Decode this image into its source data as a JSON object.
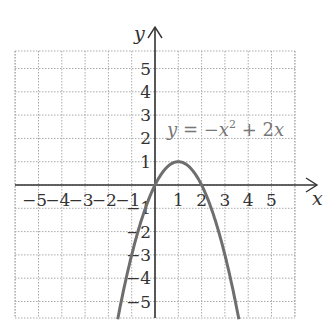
{
  "chart_data": {
    "type": "line",
    "title": "",
    "equation": "y = −x² + 2x",
    "eq_parts": {
      "lhs": "y",
      "eq": " = −",
      "x": "x",
      "exp": "2",
      "rest": " + 2",
      "x2": "x"
    },
    "xlabel": "x",
    "ylabel": "y",
    "xlim": [
      -6,
      6
    ],
    "ylim": [
      -6,
      6
    ],
    "x_ticks": [
      "−5",
      "−4",
      "−3",
      "−2",
      "−1",
      "1",
      "2",
      "3",
      "4",
      "5"
    ],
    "x_tick_values": [
      -5,
      -4,
      -3,
      -2,
      -1,
      1,
      2,
      3,
      4,
      5
    ],
    "y_ticks": [
      "5",
      "4",
      "3",
      "2",
      "1",
      "−1",
      "−2",
      "−3",
      "−4",
      "−5"
    ],
    "y_tick_values": [
      5,
      4,
      3,
      2,
      1,
      -1,
      -2,
      -3,
      -4,
      -5
    ],
    "grid": true,
    "series": [
      {
        "name": "y = -x^2 + 2x",
        "color": "#6e6e6e",
        "x": [
          -1.6,
          -1,
          0,
          0.5,
          1,
          1.5,
          2,
          3,
          3.6
        ],
        "y": [
          -5.76,
          -3,
          0,
          0.75,
          1,
          0.75,
          0,
          -3,
          -5.76
        ]
      }
    ]
  },
  "colors": {
    "axis": "#333333",
    "grid": "#aaaaaa",
    "curve": "#6e6e6e"
  }
}
